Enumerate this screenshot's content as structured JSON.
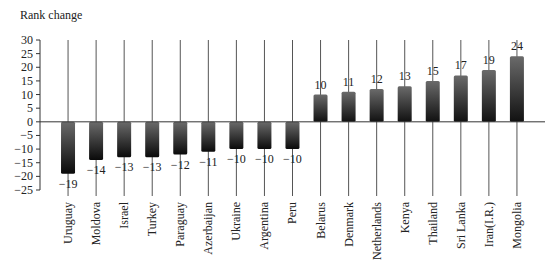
{
  "chart_data": {
    "type": "bar",
    "title": "",
    "ylabel": "Rank change",
    "xlabel": "",
    "ylim": [
      -25,
      30
    ],
    "yticks": [
      30,
      25,
      20,
      15,
      10,
      5,
      0,
      -5,
      -10,
      -15,
      -20,
      -25
    ],
    "ytick_labels": [
      "30",
      "25",
      "20",
      "15",
      "10",
      "5",
      "0",
      "−5",
      "−10",
      "−15",
      "−20",
      "−25"
    ],
    "grid": false,
    "category_separators": true,
    "legend": null,
    "categories": [
      "Uruguay",
      "Moldova",
      "Israel",
      "Turkey",
      "Paraguay",
      "Azerbaijan",
      "Ukraine",
      "Argentina",
      "Peru",
      "Belarus",
      "Denmark",
      "Netherlands",
      "Kenya",
      "Thailand",
      "Sri Lanka",
      "Iran(I.R.)",
      "Mongolia"
    ],
    "values": [
      -19,
      -14,
      -13,
      -13,
      -12,
      -11,
      -10,
      -10,
      -10,
      10,
      11,
      12,
      13,
      15,
      17,
      19,
      24
    ],
    "data_labels": [
      "−19",
      "−14",
      "−13",
      "−13",
      "−12",
      "−11",
      "−10",
      "−10",
      "−10",
      "10",
      "11",
      "12",
      "13",
      "15",
      "17",
      "19",
      "24"
    ]
  },
  "colors": {
    "bar_dark": "#111111",
    "bar_mid": "#555555",
    "axis": "#333333",
    "separator": "#555555"
  }
}
